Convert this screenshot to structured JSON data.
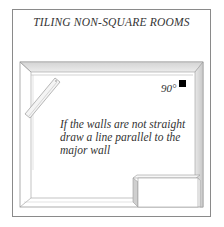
{
  "title": "TILING NON-SQUARE ROOMS",
  "angle_label": "90°",
  "caption": {
    "line1": "If the walls are not straight",
    "line2": "draw a line parallel to the",
    "line3": "major wall"
  },
  "elements": {
    "right_angle_marker": "black-square-icon",
    "plank": "straightedge-plank",
    "box": "box-obstacle"
  },
  "colors": {
    "frame": "#8a8a8a",
    "wall_shade": "#cfcfcf",
    "wall_light": "#ececec",
    "line": "#9a9a9a",
    "marker": "#000000",
    "text": "#333333"
  }
}
